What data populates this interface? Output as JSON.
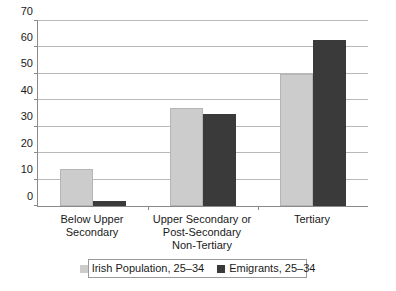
{
  "chart_data": {
    "type": "bar",
    "title": "",
    "xlabel": "",
    "ylabel": "",
    "ylim": [
      0,
      70
    ],
    "ytick_step": 10,
    "yticks": [
      "0",
      "10",
      "20",
      "30",
      "40",
      "50",
      "60",
      "70"
    ],
    "grid": true,
    "legend_position": "bottom",
    "categories": [
      "Below Upper Secondary",
      "Upper Secondary or\nPost-Secondary\nNon-Tertiary",
      "Tertiary"
    ],
    "category_lines": [
      [
        "Below Upper Secondary"
      ],
      [
        "Upper Secondary or",
        "Post-Secondary",
        "Non-Tertiary"
      ],
      [
        "Tertiary"
      ]
    ],
    "series": [
      {
        "name": "Irish Population, 25–34",
        "color": "#cccccc",
        "values": [
          14,
          37,
          50
        ]
      },
      {
        "name": "Emigrants, 25–34",
        "color": "#3a3a3a",
        "values": [
          2,
          35,
          63
        ]
      }
    ]
  },
  "legend": {
    "items": [
      {
        "label": "Irish Population, 25–34",
        "swatch": "#cccccc"
      },
      {
        "label": "Emigrants, 25–34",
        "swatch": "#3a3a3a"
      }
    ]
  },
  "colors": {
    "series_light": "#cccccc",
    "series_dark": "#3a3a3a",
    "axis": "#8a8a8a",
    "gridline": "#b8b8b8",
    "background": "#ffffff",
    "text": "#1a1a1a"
  }
}
